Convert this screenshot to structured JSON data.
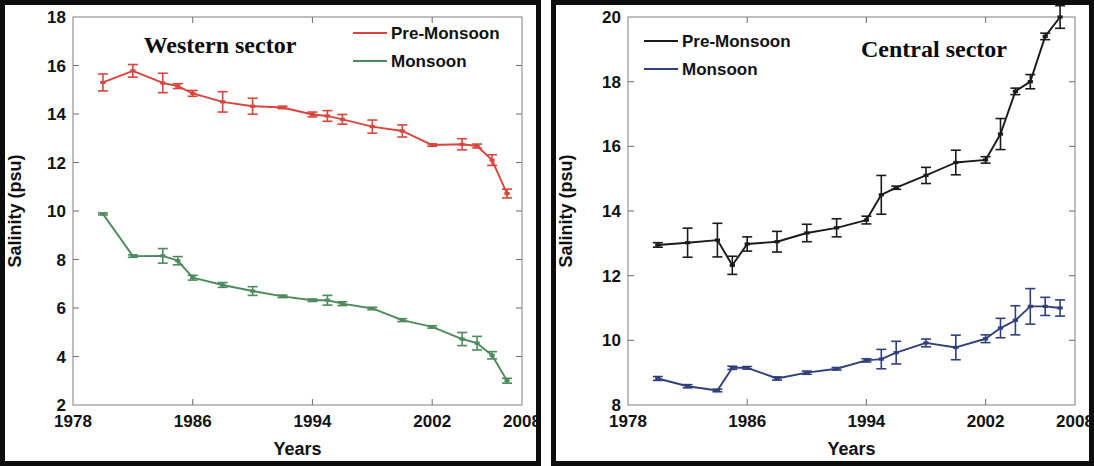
{
  "figure": {
    "panels": [
      {
        "name": "western",
        "title": "Western sector",
        "xlabel": "Years",
        "ylabel": "Salinity (psu)",
        "legend": [
          {
            "label": "Pre-Monsoon",
            "color": "#d9453c"
          },
          {
            "label": "Monsoon",
            "color": "#4e8a5e"
          }
        ],
        "xticks": [
          "1978",
          "1986",
          "1994",
          "2002",
          "2008"
        ],
        "yticks": [
          "2",
          "4",
          "6",
          "8",
          "10",
          "12",
          "14",
          "16",
          "18"
        ]
      },
      {
        "name": "central",
        "title": "Central sector",
        "xlabel": "Years",
        "ylabel": "Salinity (psu)",
        "legend": [
          {
            "label": "Pre-Monsoon",
            "color": "#1a1a1a"
          },
          {
            "label": "Monsoon",
            "color": "#30407a"
          }
        ],
        "xticks": [
          "1978",
          "1986",
          "1994",
          "2002",
          "2008"
        ],
        "yticks": [
          "8",
          "10",
          "12",
          "14",
          "16",
          "18",
          "20"
        ]
      }
    ]
  },
  "chart_data": [
    {
      "type": "line",
      "title": "Western sector",
      "xlabel": "Years",
      "ylabel": "Salinity (psu)",
      "xlim": [
        1978,
        2008
      ],
      "ylim": [
        2,
        18
      ],
      "xticks": [
        1978,
        1986,
        1994,
        2002,
        2008
      ],
      "yticks": [
        2,
        4,
        6,
        8,
        10,
        12,
        14,
        16,
        18
      ],
      "grid": false,
      "legend_position": "top-right",
      "errorbars": true,
      "series": [
        {
          "name": "Pre-Monsoon",
          "color": "#d9453c",
          "x": [
            1980,
            1982,
            1984,
            1985,
            1986,
            1988,
            1990,
            1992,
            1994,
            1995,
            1996,
            1998,
            2000,
            2002,
            2004,
            2005,
            2006,
            2007
          ],
          "values": [
            15.3,
            15.78,
            15.28,
            15.15,
            14.85,
            14.5,
            14.32,
            14.27,
            13.98,
            13.92,
            13.78,
            13.48,
            13.3,
            12.72,
            12.75,
            12.68,
            12.1,
            10.72
          ],
          "yerr": [
            0.35,
            0.26,
            0.4,
            0.1,
            0.12,
            0.42,
            0.33,
            0.05,
            0.1,
            0.22,
            0.2,
            0.27,
            0.25,
            0.05,
            0.23,
            0.08,
            0.22,
            0.18
          ]
        },
        {
          "name": "Monsoon",
          "color": "#4e8a5e",
          "x": [
            1980,
            1982,
            1984,
            1985,
            1986,
            1988,
            1990,
            1992,
            1994,
            1995,
            1996,
            1998,
            2000,
            2002,
            2004,
            2005,
            2006,
            2007
          ],
          "values": [
            9.88,
            8.14,
            8.15,
            7.95,
            7.25,
            6.95,
            6.7,
            6.48,
            6.32,
            6.32,
            6.18,
            5.98,
            5.5,
            5.22,
            4.72,
            4.55,
            4.05,
            3.0
          ],
          "yerr": [
            0.04,
            0.05,
            0.3,
            0.17,
            0.1,
            0.1,
            0.18,
            0.05,
            0.05,
            0.2,
            0.08,
            0.05,
            0.06,
            0.05,
            0.27,
            0.28,
            0.15,
            0.1
          ]
        }
      ]
    },
    {
      "type": "line",
      "title": "Central sector",
      "xlabel": "Years",
      "ylabel": "Salinity (psu)",
      "xlim": [
        1978,
        2008
      ],
      "ylim": [
        8,
        20
      ],
      "xticks": [
        1978,
        1986,
        1994,
        2002,
        2008
      ],
      "yticks": [
        8,
        10,
        12,
        14,
        16,
        18,
        20
      ],
      "grid": false,
      "legend_position": "top-left",
      "errorbars": true,
      "series": [
        {
          "name": "Pre-Monsoon",
          "color": "#1a1a1a",
          "x": [
            1980,
            1982,
            1984,
            1985,
            1986,
            1988,
            1990,
            1992,
            1994,
            1995,
            1996,
            1998,
            2000,
            2002,
            2003,
            2004,
            2005,
            2006,
            2007
          ],
          "values": [
            12.95,
            13.02,
            13.1,
            12.32,
            12.98,
            13.05,
            13.32,
            13.48,
            13.72,
            14.5,
            14.72,
            15.1,
            15.5,
            15.58,
            16.38,
            17.7,
            18.0,
            19.4,
            20.0
          ],
          "yerr": [
            0.07,
            0.45,
            0.52,
            0.28,
            0.22,
            0.32,
            0.27,
            0.28,
            0.12,
            0.6,
            0.05,
            0.25,
            0.38,
            0.1,
            0.48,
            0.1,
            0.22,
            0.1,
            0.35
          ]
        },
        {
          "name": "Monsoon",
          "color": "#30407a",
          "x": [
            1980,
            1982,
            1984,
            1985,
            1986,
            1988,
            1990,
            1992,
            1994,
            1995,
            1996,
            1998,
            2000,
            2002,
            2003,
            2004,
            2005,
            2006,
            2007
          ],
          "values": [
            8.82,
            8.58,
            8.45,
            9.15,
            9.15,
            8.82,
            9.0,
            9.12,
            9.38,
            9.42,
            9.62,
            9.92,
            9.78,
            10.05,
            10.38,
            10.62,
            11.05,
            11.05,
            11.0
          ],
          "yerr": [
            0.06,
            0.05,
            0.04,
            0.05,
            0.04,
            0.05,
            0.05,
            0.04,
            0.05,
            0.3,
            0.35,
            0.12,
            0.38,
            0.12,
            0.3,
            0.45,
            0.55,
            0.28,
            0.25
          ]
        }
      ]
    }
  ]
}
